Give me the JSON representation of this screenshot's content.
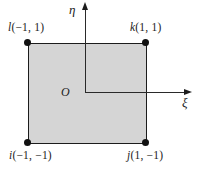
{
  "diagram": {
    "axes": {
      "vertical_label": "η",
      "horizontal_label": "ξ",
      "origin_label": "O"
    },
    "corners": [
      {
        "letter": "l",
        "coords": "(−1, 1)",
        "position": "top-left"
      },
      {
        "letter": "k",
        "coords": "(1, 1)",
        "position": "top-right"
      },
      {
        "letter": "i",
        "coords": "(−1, −1)",
        "position": "bottom-left"
      },
      {
        "letter": "j",
        "coords": "(1, −1)",
        "position": "bottom-right"
      }
    ],
    "colors": {
      "square_fill": "#d5d5d5",
      "line": "#1c1c1c"
    }
  }
}
